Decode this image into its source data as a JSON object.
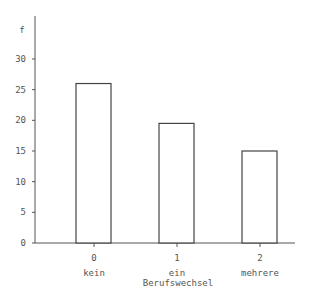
{
  "chart_data": {
    "type": "bar",
    "title": "",
    "ylabel": "f",
    "xlabel": "Berufswechsel",
    "ylim": [
      0,
      35
    ],
    "yticks": [
      0,
      5,
      10,
      15,
      20,
      25,
      30
    ],
    "categories": [
      "0",
      "1",
      "2"
    ],
    "category_sublabels": [
      "kein",
      "ein",
      "mehrere"
    ],
    "values": [
      26,
      19.5,
      15
    ],
    "grid": false,
    "legend": "none"
  }
}
